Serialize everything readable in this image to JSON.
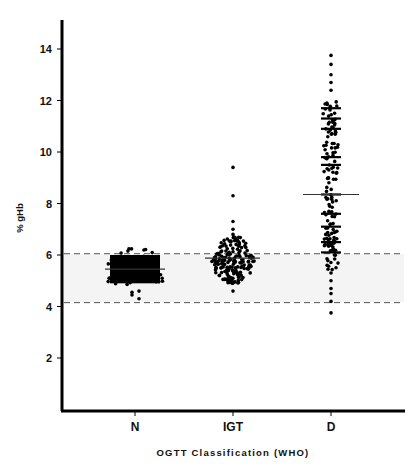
{
  "chart_data": {
    "type": "scatter",
    "subtype": "dot-strip-plot",
    "title": "",
    "xlabel": "OGTT Classification (WHO)",
    "ylabel": "% gHb",
    "categories": [
      "N",
      "IGT",
      "D"
    ],
    "ylim": [
      0,
      15
    ],
    "yticks": [
      2,
      4,
      6,
      8,
      10,
      12,
      14
    ],
    "grid": false,
    "legend": null,
    "reference_lines": [
      {
        "y": 6.05,
        "style": "dashed",
        "label": "upper normal limit"
      },
      {
        "y": 4.15,
        "style": "dashed",
        "label": "lower normal limit"
      }
    ],
    "series": [
      {
        "name": "N",
        "mean": 5.45,
        "min": 4.3,
        "max": 6.35,
        "dense_range": [
          4.9,
          6.0
        ],
        "n_approx": 250
      },
      {
        "name": "IGT",
        "mean": 5.88,
        "min": 4.6,
        "max": 9.4,
        "dense_range": [
          5.1,
          6.6
        ],
        "outliers": [
          9.4,
          8.3,
          7.3,
          7.0,
          6.8
        ],
        "n_approx": 120
      },
      {
        "name": "D",
        "mean": 8.35,
        "min": 3.75,
        "max": 13.75,
        "dense_range": [
          5.5,
          11.8
        ],
        "n_approx": 150
      }
    ]
  },
  "axis": {
    "y_title": "% gHb",
    "x_title": "OGTT Classification (WHO)",
    "y_ticks": [
      "2",
      "4",
      "6",
      "8",
      "10",
      "12",
      "14"
    ],
    "categories": [
      "N",
      "IGT",
      "D"
    ]
  }
}
